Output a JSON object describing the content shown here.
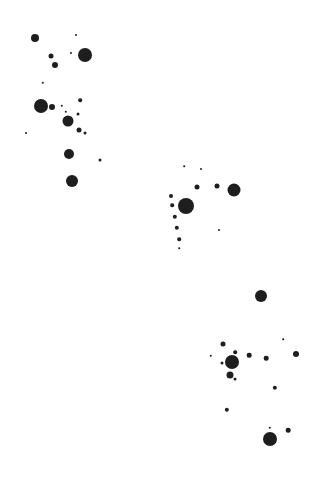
{
  "canvas": {
    "width": 318,
    "height": 480,
    "background": "#ffffff",
    "dot_color": "#1e1e1e"
  },
  "dots": [
    {
      "x": 35,
      "y": 38,
      "r": 4
    },
    {
      "x": 76,
      "y": 35,
      "r": 1
    },
    {
      "x": 85,
      "y": 55,
      "r": 7
    },
    {
      "x": 71,
      "y": 53,
      "r": 1
    },
    {
      "x": 51,
      "y": 56,
      "r": 2.5
    },
    {
      "x": 55,
      "y": 65,
      "r": 3
    },
    {
      "x": 43,
      "y": 83,
      "r": 1.2
    },
    {
      "x": 41,
      "y": 106,
      "r": 7
    },
    {
      "x": 52,
      "y": 107,
      "r": 3
    },
    {
      "x": 62,
      "y": 106,
      "r": 1.2
    },
    {
      "x": 66,
      "y": 112,
      "r": 1.2
    },
    {
      "x": 80,
      "y": 100,
      "r": 1.8
    },
    {
      "x": 78,
      "y": 114,
      "r": 1.5
    },
    {
      "x": 68,
      "y": 121,
      "r": 5.5
    },
    {
      "x": 79,
      "y": 130,
      "r": 2.5
    },
    {
      "x": 85,
      "y": 133,
      "r": 1.5
    },
    {
      "x": 26,
      "y": 133,
      "r": 1
    },
    {
      "x": 69,
      "y": 154,
      "r": 5
    },
    {
      "x": 100,
      "y": 160,
      "r": 1.5
    },
    {
      "x": 72,
      "y": 181,
      "r": 6
    },
    {
      "x": 184,
      "y": 166,
      "r": 0.8
    },
    {
      "x": 201,
      "y": 169,
      "r": 1
    },
    {
      "x": 197,
      "y": 187,
      "r": 2.5
    },
    {
      "x": 217,
      "y": 186,
      "r": 2.5
    },
    {
      "x": 234,
      "y": 190,
      "r": 6.5
    },
    {
      "x": 171,
      "y": 196,
      "r": 2
    },
    {
      "x": 172,
      "y": 205,
      "r": 1.8
    },
    {
      "x": 186,
      "y": 206,
      "r": 8
    },
    {
      "x": 175,
      "y": 217,
      "r": 2.2
    },
    {
      "x": 177,
      "y": 228,
      "r": 2.2
    },
    {
      "x": 219,
      "y": 230,
      "r": 1
    },
    {
      "x": 179,
      "y": 239,
      "r": 1.8
    },
    {
      "x": 179,
      "y": 248,
      "r": 0.8
    },
    {
      "x": 261,
      "y": 296,
      "r": 6
    },
    {
      "x": 283,
      "y": 339,
      "r": 0.8
    },
    {
      "x": 223,
      "y": 344,
      "r": 2.5
    },
    {
      "x": 211,
      "y": 356,
      "r": 1.2
    },
    {
      "x": 235,
      "y": 352,
      "r": 1.8
    },
    {
      "x": 249,
      "y": 355,
      "r": 2.3
    },
    {
      "x": 232,
      "y": 362,
      "r": 7
    },
    {
      "x": 222,
      "y": 363,
      "r": 1.5
    },
    {
      "x": 266,
      "y": 358,
      "r": 2.3
    },
    {
      "x": 296,
      "y": 354,
      "r": 3
    },
    {
      "x": 230,
      "y": 375,
      "r": 3.5
    },
    {
      "x": 235,
      "y": 379,
      "r": 1.5
    },
    {
      "x": 275,
      "y": 388,
      "r": 2.2
    },
    {
      "x": 227,
      "y": 410,
      "r": 2.2
    },
    {
      "x": 270,
      "y": 428,
      "r": 1.2
    },
    {
      "x": 288,
      "y": 430,
      "r": 2.3
    },
    {
      "x": 270,
      "y": 439,
      "r": 7
    }
  ]
}
